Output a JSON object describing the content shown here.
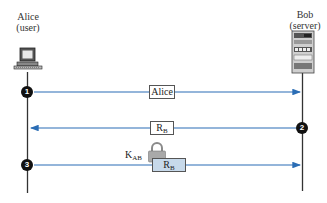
{
  "parties": {
    "alice": {
      "name": "Alice",
      "role": "(user)",
      "icon": "computer-icon"
    },
    "bob": {
      "name": "Bob",
      "role": "(server)",
      "icon": "server-icon"
    }
  },
  "messages": [
    {
      "step": "1",
      "direction": "alice-to-bob",
      "label": "Alice",
      "label_sub": ""
    },
    {
      "step": "2",
      "direction": "bob-to-alice",
      "label": "R",
      "label_sub": "B"
    },
    {
      "step": "3",
      "direction": "alice-to-bob",
      "label": "R",
      "label_sub": "B",
      "encrypted_with": {
        "key": "K",
        "key_sub": "AB",
        "icon": "lock-icon"
      }
    }
  ],
  "colors": {
    "arrow": "#2a6db5",
    "lifeline": "#333333",
    "badge": "#111111",
    "encrypted_box": "#c7d9ea"
  }
}
